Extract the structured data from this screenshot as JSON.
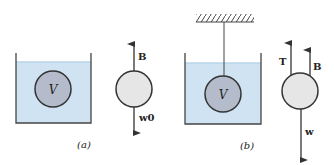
{
  "figure": {
    "panels": [
      {
        "id": "a",
        "caption": "(a)",
        "body_label": "V",
        "forces": [
          {
            "name": "buoyancy",
            "label": "B",
            "direction": "up"
          },
          {
            "name": "weight",
            "label": "w0",
            "direction": "down"
          }
        ]
      },
      {
        "id": "b",
        "caption": "(b)",
        "body_label": "V",
        "forces": [
          {
            "name": "tension",
            "label": "T",
            "direction": "up"
          },
          {
            "name": "buoyancy",
            "label": "B",
            "direction": "up"
          },
          {
            "name": "weight",
            "label": "w",
            "direction": "down"
          }
        ]
      }
    ],
    "colors": {
      "water": "#cfe3f2",
      "water_surface": "#b9d5ea",
      "submerged_body": "#b4bccb",
      "free_body": "#e6e6e6",
      "stroke": "#333333"
    }
  }
}
